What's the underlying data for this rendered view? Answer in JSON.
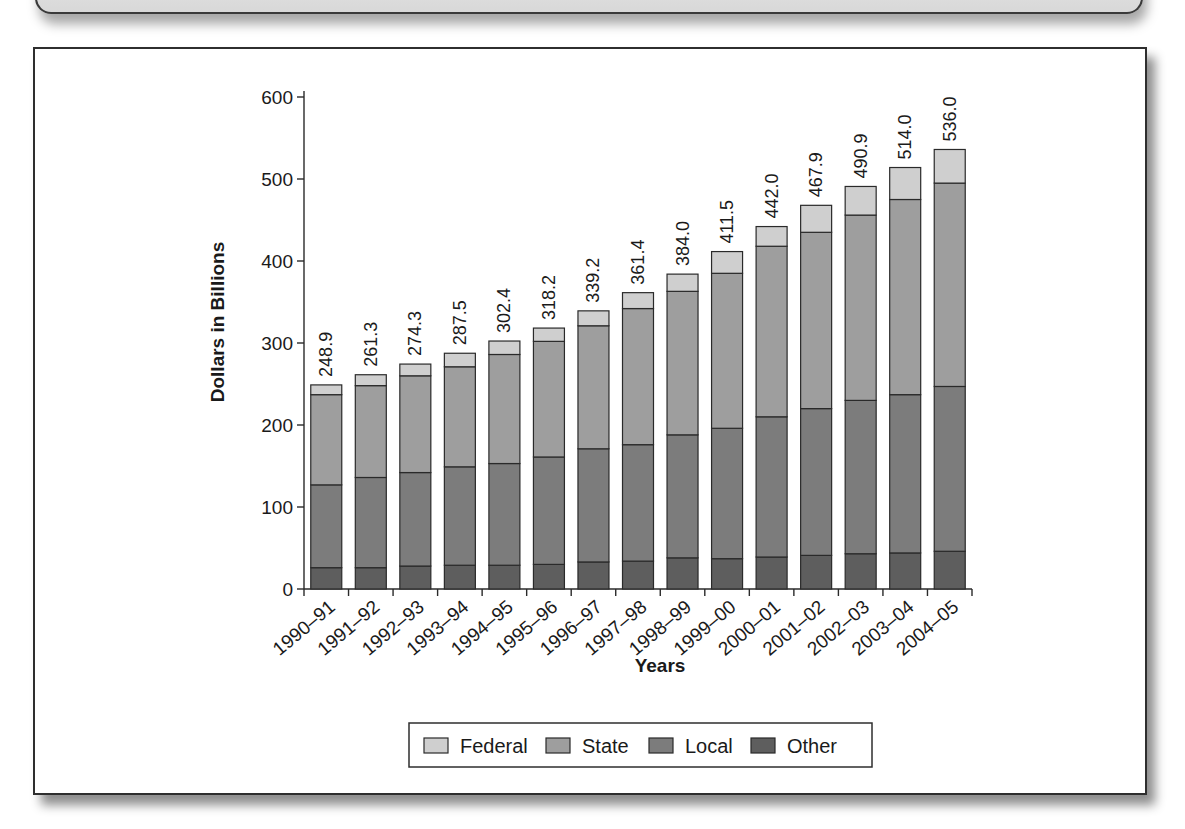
{
  "top_callout": {
    "text": ""
  },
  "chart_data": {
    "type": "bar",
    "stacked": true,
    "title": "",
    "xlabel": "Years",
    "ylabel": "Dollars in Billions",
    "ylim": [
      0,
      600
    ],
    "yticks": [
      0,
      100,
      200,
      300,
      400,
      500,
      600
    ],
    "grid": false,
    "legend_position": "bottom",
    "categories": [
      "1990–91",
      "1991–92",
      "1992–93",
      "1993–94",
      "1994–95",
      "1995–96",
      "1996–97",
      "1997–98",
      "1998–99",
      "1999–00",
      "2000–01",
      "2001–02",
      "2002–03",
      "2003–04",
      "2004–05"
    ],
    "totals": [
      248.9,
      261.3,
      274.3,
      287.5,
      302.4,
      318.2,
      339.2,
      361.4,
      384.0,
      411.5,
      442.0,
      467.9,
      490.9,
      514.0,
      536.0
    ],
    "total_labels": [
      "248.9",
      "261.3",
      "274.3",
      "287.5",
      "302.4",
      "318.2",
      "339.2",
      "361.4",
      "384.0",
      "411.5",
      "442.0",
      "467.9",
      "490.9",
      "514.0",
      "536.0"
    ],
    "series": [
      {
        "name": "Other",
        "color": "#5e5e5e",
        "values": [
          26,
          26,
          28,
          29,
          29,
          30,
          33,
          34,
          38,
          37,
          39,
          41,
          43,
          44,
          46
        ]
      },
      {
        "name": "Local",
        "color": "#7c7c7c",
        "values": [
          101,
          110,
          114,
          120,
          124,
          131,
          138,
          142,
          150,
          159,
          171,
          179,
          187,
          193,
          201
        ]
      },
      {
        "name": "State",
        "color": "#9e9e9e",
        "values": [
          110,
          112,
          118,
          122,
          133,
          141,
          150,
          166,
          175,
          189,
          208,
          215,
          226,
          238,
          248
        ]
      },
      {
        "name": "Federal",
        "color": "#cfcfcf",
        "values": [
          11.9,
          13.3,
          14.3,
          16.5,
          16.4,
          16.2,
          18.2,
          19.4,
          21.0,
          26.5,
          24.0,
          32.9,
          34.9,
          39.0,
          41.0
        ]
      }
    ],
    "legend": [
      {
        "label": "Federal",
        "color": "#cfcfcf"
      },
      {
        "label": "State",
        "color": "#9e9e9e"
      },
      {
        "label": "Local",
        "color": "#7c7c7c"
      },
      {
        "label": "Other",
        "color": "#5e5e5e"
      }
    ]
  }
}
